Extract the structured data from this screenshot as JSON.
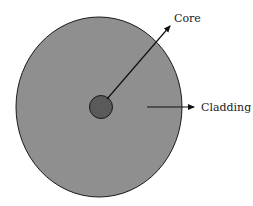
{
  "diagram": {
    "labels": {
      "core": "Core",
      "cladding": "Cladding"
    },
    "colors": {
      "cladding_fill": "#8f8f8f",
      "core_fill": "#5a5a5a",
      "outline": "#1a1a1a",
      "arrow": "#111111"
    }
  }
}
